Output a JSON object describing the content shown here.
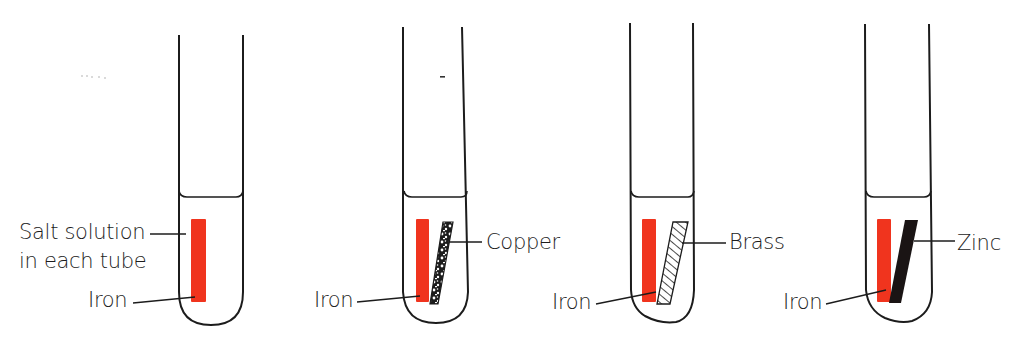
{
  "diagram": {
    "type": "experiment-setup",
    "tubes": [
      {
        "id": "tube-1",
        "metal_pair": [
          "Iron"
        ],
        "labels": {
          "solution_line1": "Salt solution",
          "solution_line2": "in each tube",
          "iron": "Iron"
        }
      },
      {
        "id": "tube-2",
        "metal_pair": [
          "Iron",
          "Copper"
        ],
        "labels": {
          "iron": "Iron",
          "second_metal": "Copper"
        },
        "second_metal_fill": "speckled"
      },
      {
        "id": "tube-3",
        "metal_pair": [
          "Iron",
          "Brass"
        ],
        "labels": {
          "iron": "Iron",
          "second_metal": "Brass"
        },
        "second_metal_fill": "hatched"
      },
      {
        "id": "tube-4",
        "metal_pair": [
          "Iron",
          "Zinc"
        ],
        "labels": {
          "iron": "Iron",
          "second_metal": "Zinc"
        },
        "second_metal_fill": "solid-black"
      }
    ],
    "colors": {
      "iron": "#F0341E",
      "outline": "#1c1c1c",
      "zinc": "#1a1414",
      "background": "#ffffff"
    }
  }
}
